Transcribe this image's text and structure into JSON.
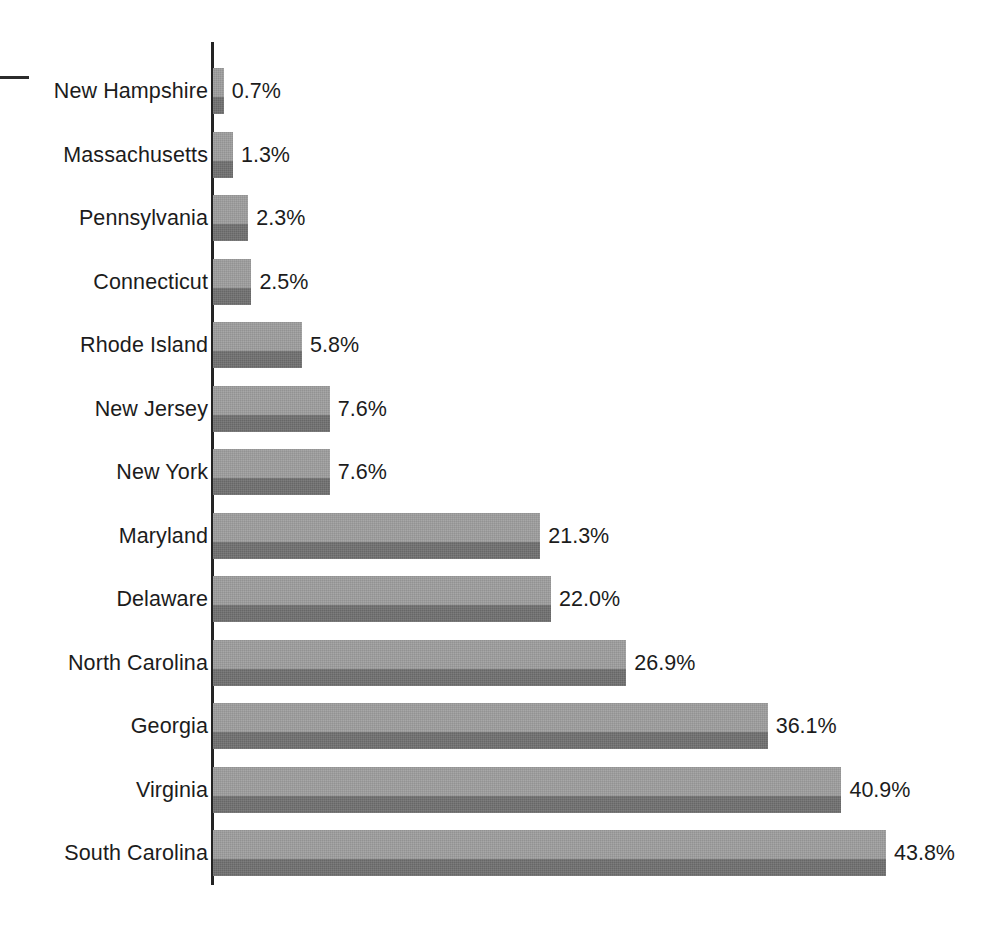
{
  "chart_data": {
    "type": "bar",
    "orientation": "horizontal",
    "title": "",
    "subtitle": "",
    "xlabel": "",
    "ylabel": "",
    "legend": [],
    "grid": false,
    "xlim": [
      0,
      43.8
    ],
    "value_suffix": "%",
    "categories": [
      "New Hampshire",
      "Massachusetts",
      "Pennsylvania",
      "Connecticut",
      "Rhode Island",
      "New Jersey",
      "New York",
      "Maryland",
      "Delaware",
      "North Carolina",
      "Georgia",
      "Virginia",
      "South Carolina"
    ],
    "values": [
      0.7,
      1.3,
      2.3,
      2.5,
      5.8,
      7.6,
      7.6,
      21.3,
      22.0,
      26.9,
      36.1,
      40.9,
      43.8
    ],
    "value_labels": [
      "0.7%",
      "1.3%",
      "2.3%",
      "2.5%",
      "5.8%",
      "7.6%",
      "7.6%",
      "21.3%",
      "22.0%",
      "26.9%",
      "36.1%",
      "40.9%",
      "43.8%"
    ],
    "colors": {
      "bar_light": "#9d9d9d",
      "bar_dark": "#6f6f6f",
      "axis": "#232323",
      "text": "#1c1c1c",
      "background": "#ffffff"
    }
  },
  "axis": {
    "name": "category-axis"
  },
  "marks": {
    "left_dash": "—"
  }
}
